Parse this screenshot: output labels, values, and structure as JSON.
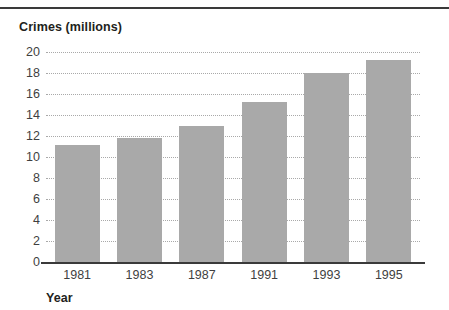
{
  "chart_data": {
    "type": "bar",
    "title": "",
    "ylabel": "Crimes (millions)",
    "xlabel": "Year",
    "categories": [
      "1981",
      "1983",
      "1987",
      "1991",
      "1993",
      "1995"
    ],
    "values": [
      11.1,
      11.8,
      13.0,
      15.2,
      18.0,
      19.2
    ],
    "series": [
      {
        "name": "Crimes",
        "values": [
          11.1,
          11.8,
          13.0,
          15.2,
          18.0,
          19.2
        ]
      }
    ],
    "ylim": [
      0,
      20
    ],
    "yticks": [
      0,
      2,
      4,
      6,
      8,
      10,
      12,
      14,
      16,
      18,
      20
    ],
    "ytick_labels": [
      "0",
      "2",
      "4",
      "6",
      "8",
      "10",
      "12",
      "14",
      "16",
      "18",
      "20"
    ],
    "grid": true,
    "grid_axis": "y",
    "legend": false,
    "bar_color": "#a9a9a9",
    "axis_color": "#3a3a3a",
    "grid_color": "#a9a9a9",
    "text_color": "#3f3f3f"
  }
}
